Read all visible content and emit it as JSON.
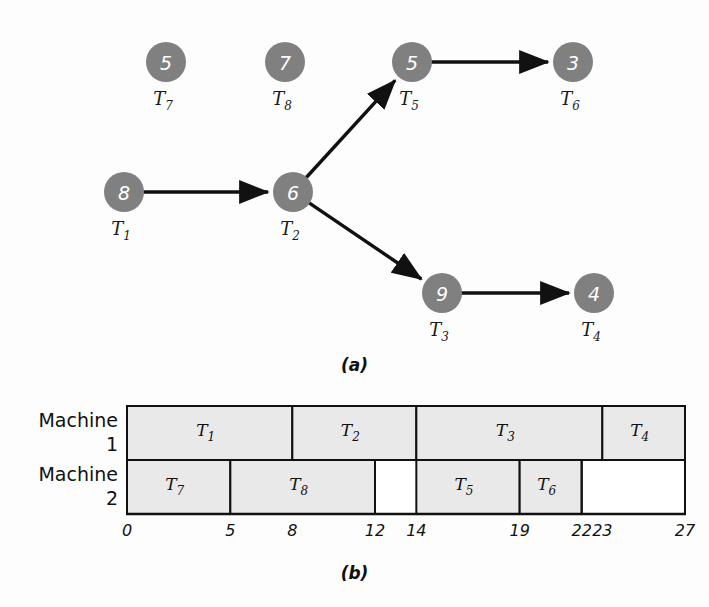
{
  "figure": {
    "caption_a": "(a)",
    "caption_b": "(b)"
  },
  "colors": {
    "node_fill": "#808080",
    "node_text": "#ffffff",
    "edge": "#111111",
    "bar_fill": "#e9e9e9",
    "bar_stroke": "#111111",
    "background": "#fdfdfd"
  },
  "task_graph": {
    "type": "directed-acyclic-graph",
    "nodes": [
      {
        "id": "T1",
        "label": "T",
        "subscript": "1",
        "weight": "8",
        "cx": 124,
        "cy": 192
      },
      {
        "id": "T2",
        "label": "T",
        "subscript": "2",
        "weight": "6",
        "cx": 293,
        "cy": 192
      },
      {
        "id": "T3",
        "label": "T",
        "subscript": "3",
        "weight": "9",
        "cx": 442,
        "cy": 293
      },
      {
        "id": "T4",
        "label": "T",
        "subscript": "4",
        "weight": "4",
        "cx": 594,
        "cy": 293
      },
      {
        "id": "T5",
        "label": "T",
        "subscript": "5",
        "weight": "5",
        "cx": 412,
        "cy": 62
      },
      {
        "id": "T6",
        "label": "T",
        "subscript": "6",
        "weight": "3",
        "cx": 573,
        "cy": 62
      },
      {
        "id": "T7",
        "label": "T",
        "subscript": "7",
        "weight": "5",
        "cx": 166,
        "cy": 62
      },
      {
        "id": "T8",
        "label": "T",
        "subscript": "8",
        "weight": "7",
        "cx": 285,
        "cy": 62
      }
    ],
    "node_radius": 20,
    "edges": [
      {
        "from": "T1",
        "to": "T2"
      },
      {
        "from": "T2",
        "to": "T5"
      },
      {
        "from": "T2",
        "to": "T3"
      },
      {
        "from": "T5",
        "to": "T6"
      },
      {
        "from": "T3",
        "to": "T4"
      }
    ]
  },
  "gantt": {
    "type": "gantt",
    "axis_start": 0,
    "axis_end": 27,
    "tick_labels": [
      "0",
      "5",
      "8",
      "12",
      "14",
      "19",
      "22",
      "23",
      "27"
    ],
    "ticks": [
      0,
      5,
      8,
      12,
      14,
      19,
      22,
      23,
      27
    ],
    "rows": [
      {
        "name": "Machine",
        "number": "1",
        "tasks": [
          {
            "label": "T",
            "subscript": "1",
            "start": 0,
            "end": 8
          },
          {
            "label": "T",
            "subscript": "2",
            "start": 8,
            "end": 14
          },
          {
            "label": "T",
            "subscript": "3",
            "start": 14,
            "end": 23
          },
          {
            "label": "T",
            "subscript": "4",
            "start": 23,
            "end": 27
          }
        ]
      },
      {
        "name": "Machine",
        "number": "2",
        "tasks": [
          {
            "label": "T",
            "subscript": "7",
            "start": 0,
            "end": 5
          },
          {
            "label": "T",
            "subscript": "8",
            "start": 5,
            "end": 12
          },
          {
            "label": "T",
            "subscript": "5",
            "start": 14,
            "end": 19
          },
          {
            "label": "T",
            "subscript": "6",
            "start": 19,
            "end": 22
          }
        ]
      }
    ]
  }
}
